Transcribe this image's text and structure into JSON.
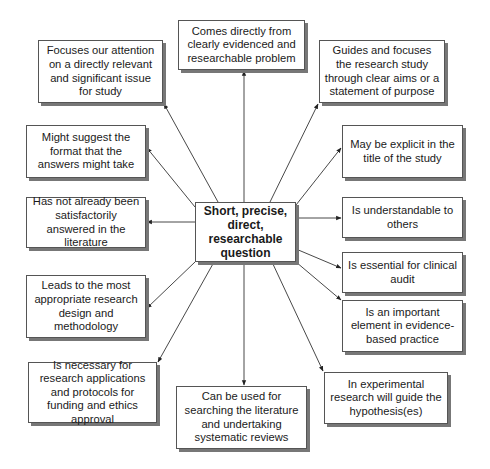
{
  "diagram": {
    "type": "mind-map",
    "center": {
      "label": "Short, precise, direct, researchable question"
    },
    "nodes": [
      {
        "id": "comes-directly",
        "label": "Comes directly from clearly evidenced and researchable problem"
      },
      {
        "id": "focuses-attention",
        "label": "Focuses our attention on a directly relevant and significant issue for study"
      },
      {
        "id": "guides-focuses",
        "label": "Guides and focuses the research study through clear aims or a statement of purpose"
      },
      {
        "id": "suggest-format",
        "label": "Might suggest the format that the answers might take"
      },
      {
        "id": "explicit-title",
        "label": "May be explicit in the title of the study"
      },
      {
        "id": "not-answered",
        "label": "Has not already been satisfactorily answered in the literature"
      },
      {
        "id": "understandable",
        "label": "Is understandable to others"
      },
      {
        "id": "clinical-audit",
        "label": "Is essential for clinical audit"
      },
      {
        "id": "research-design",
        "label": "Leads to the most appropriate research design and methodology"
      },
      {
        "id": "evidence-based",
        "label": "Is an important element in evidence-based practice"
      },
      {
        "id": "funding-ethics",
        "label": "Is necessary for research applications and protocols for funding and ethics approval"
      },
      {
        "id": "searching-literature",
        "label": "Can be used for searching the literature and undertaking systematic reviews"
      },
      {
        "id": "hypothesis",
        "label": "In experimental research will guide the hypothesis(es)"
      }
    ],
    "edges": "center → each node (arrow pointing to node)"
  }
}
